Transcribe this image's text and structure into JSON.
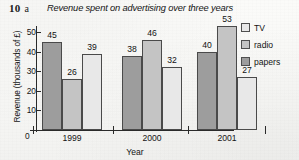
{
  "question": {
    "number": "10",
    "part": "a"
  },
  "chart_data": {
    "type": "bar",
    "title": "Revenue spent on advertising over three years",
    "xlabel": "Year",
    "ylabel": "Revenue (thousands of £)",
    "categories": [
      "1999",
      "2000",
      "2001"
    ],
    "series": [
      {
        "name": "TV",
        "values": [
          45,
          38,
          40
        ],
        "color": "#9d9d9d"
      },
      {
        "name": "radio",
        "values": [
          26,
          46,
          53
        ],
        "color": "#c4c4c4"
      },
      {
        "name": "papers",
        "values": [
          39,
          32,
          27
        ],
        "color": "#e8e8e8"
      }
    ],
    "legend": {
      "position": "right",
      "entries": [
        {
          "label": "TV",
          "color": "#e8e8e8"
        },
        {
          "label": "radio",
          "color": "#c4c4c4"
        },
        {
          "label": "papers",
          "color": "#9d9d9d"
        }
      ]
    },
    "ylim": [
      0,
      55
    ],
    "yticks": [
      "10",
      "20",
      "30",
      "40",
      "50"
    ],
    "yzero": "0",
    "grid": false,
    "value_labels_shown": true
  }
}
